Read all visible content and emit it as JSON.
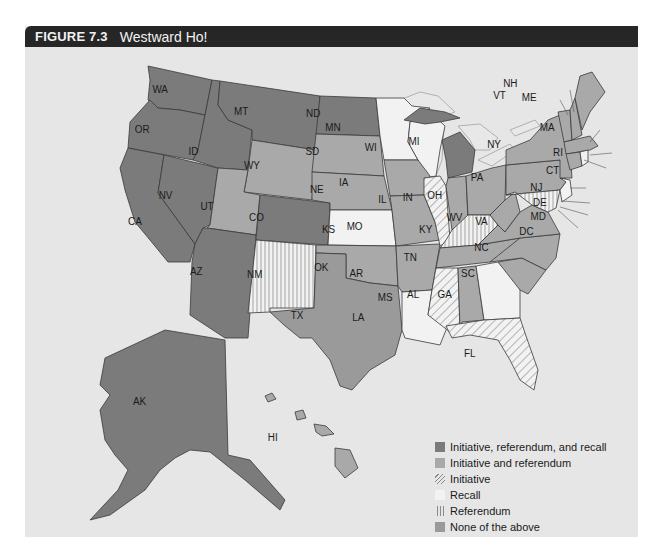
{
  "figure": {
    "number": "FIGURE 7.3",
    "title": "Westward Ho!"
  },
  "colors": {
    "initiative_referendum_recall": "#7b7b7b",
    "initiative_referendum": "#a9a9a9",
    "initiative": "#f2f2f2",
    "recall": "#f2f2f2",
    "referendum": "#f2f2f2",
    "none": "#9a9a9a",
    "background": "#e6e6e6",
    "header": "#262626"
  },
  "legend": [
    {
      "key": "irr",
      "label": "Initiative, referendum, and recall",
      "pattern": "solid-dark"
    },
    {
      "key": "ir",
      "label": "Initiative and referendum",
      "pattern": "solid-medium"
    },
    {
      "key": "i",
      "label": "Initiative",
      "pattern": "diagonal-hatch"
    },
    {
      "key": "rc",
      "label": "Recall",
      "pattern": "none"
    },
    {
      "key": "rf",
      "label": "Referendum",
      "pattern": "vertical-hatch"
    },
    {
      "key": "none",
      "label": "None of the above",
      "pattern": "solid-medium-dark"
    }
  ],
  "states": {
    "WA": "irr",
    "OR": "irr",
    "CA": "irr",
    "NV": "irr",
    "ID": "irr",
    "MT": "irr",
    "AZ": "irr",
    "CO": "irr",
    "ND": "irr",
    "MI": "irr",
    "AK": "irr",
    "WY": "ir",
    "UT": "ir",
    "SD": "ir",
    "NE": "ir",
    "OK": "ir",
    "AR": "ir",
    "MO": "ir",
    "IA": "ir",
    "OH": "ir",
    "ME": "ir",
    "MA": "ir",
    "NY": "ir",
    "PA": "ir",
    "VT": "ir",
    "NH": "ir",
    "CT": "ir",
    "HI": "ir",
    "IN": "ir",
    "WV": "ir",
    "VA": "ir",
    "NC": "ir",
    "SC": "ir",
    "TN": "ir",
    "AL": "ir",
    "TX": "none",
    "IL": "i",
    "MS": "i",
    "FL": "i",
    "MN": "rc",
    "WI": "rc",
    "KS": "rc",
    "LA": "rc",
    "GA": "rc",
    "NJ": "rc",
    "RI": "rc",
    "NM": "rf",
    "KY": "rf",
    "MD": "rf",
    "DE": "rf",
    "DC": "rf"
  },
  "labels": {
    "WA": "WA",
    "OR": "OR",
    "CA": "CA",
    "NV": "NV",
    "ID": "ID",
    "MT": "MT",
    "WY": "WY",
    "UT": "UT",
    "AZ": "AZ",
    "CO": "CO",
    "NM": "NM",
    "ND": "ND",
    "SD": "SD",
    "NE": "NE",
    "KS": "KS",
    "OK": "OK",
    "TX": "TX",
    "MN": "MN",
    "IA": "IA",
    "MO": "MO",
    "AR": "AR",
    "LA": "LA",
    "WI": "WI",
    "IL": "IL",
    "MS": "MS",
    "MI": "MI",
    "IN": "IN",
    "KY": "KY",
    "TN": "TN",
    "AL": "AL",
    "OH": "OH",
    "WV": "WV",
    "VA": "VA",
    "NC": "NC",
    "SC": "SC",
    "GA": "GA",
    "FL": "FL",
    "PA": "PA",
    "NY": "NY",
    "VT": "VT",
    "NH": "NH",
    "ME": "ME",
    "MA": "MA",
    "RI": "RI",
    "CT": "CT",
    "NJ": "NJ",
    "DE": "DE",
    "MD": "MD",
    "DC": "DC",
    "AK": "AK",
    "HI": "HI"
  }
}
